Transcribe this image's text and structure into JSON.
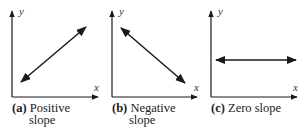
{
  "figure": {
    "panels": [
      {
        "id": "a",
        "letter": "(a)",
        "caption_line1": "Positive",
        "caption_line2": "slope",
        "x_axis_label": "x",
        "y_axis_label": "y",
        "line": {
          "x1": 21,
          "y1": 82,
          "x2": 86,
          "y2": 27
        }
      },
      {
        "id": "b",
        "letter": "(b)",
        "caption_line1": "Negative",
        "caption_line2": "slope",
        "x_axis_label": "x",
        "y_axis_label": "y",
        "line": {
          "x1": 121,
          "y1": 28,
          "x2": 185,
          "y2": 83
        }
      },
      {
        "id": "c",
        "letter": "(c)",
        "caption_line1": "Zero slope",
        "caption_line2": "",
        "x_axis_label": "x",
        "y_axis_label": "y",
        "line": {
          "x1": 216,
          "y1": 60,
          "x2": 296,
          "y2": 60
        }
      }
    ],
    "colors": {
      "stroke": "#1a1a1a",
      "text": "#222222"
    }
  }
}
